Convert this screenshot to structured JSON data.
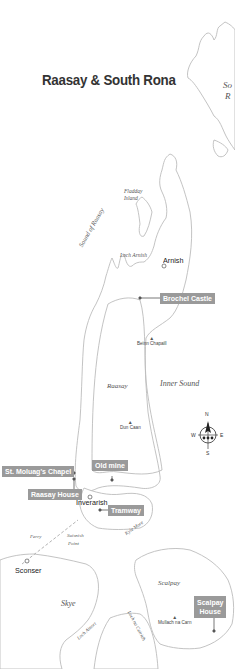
{
  "title": "Raasay & South Rona",
  "colors": {
    "coastline": "#bcbcbc",
    "label_bg": "#9a9a9a",
    "label_text": "#ffffff",
    "title_text": "#333333",
    "water_label": "#555555"
  },
  "water_labels": {
    "sound_of_rona_1": "So",
    "sound_of_rona_2": "R",
    "sound_of_raasay": "Sound of Raasay",
    "loch_arnish": "Loch Arnish",
    "inner_sound": "Inner Sound",
    "kyle_more": "Kyle More",
    "loch_ainort": "Loch Ainort",
    "loch_na_cairidh": "Loch na Cairidh",
    "ferry": "Ferry"
  },
  "islands": {
    "fladday_1": "Fladday",
    "fladday_2": "Island",
    "raasay": "Raasay",
    "skye": "Skye",
    "scalpay": "Scalpay",
    "suisnish_1": "Suisnish",
    "suisnish_2": "Point"
  },
  "towns": {
    "arnish": "Arnish",
    "inverarish": "Inverarish",
    "sconser": "Sconser"
  },
  "peaks": {
    "beinn_chapaill": "Beinn Chapaill",
    "dun_caan": "Dun Caan",
    "mullach_na_carn": "Mullach na Carn"
  },
  "sites": {
    "brochel_castle": "Brochel Castle",
    "old_mine": "Old mine",
    "st_moluags_chapel": "St. Moluag's Chapel",
    "raasay_house": "Raasay House",
    "tramway": "Tramway",
    "scalpay_house_1": "Scalpay",
    "scalpay_house_2": "House"
  },
  "compass": {
    "n": "N",
    "s": "S",
    "e": "E",
    "w": "W"
  }
}
